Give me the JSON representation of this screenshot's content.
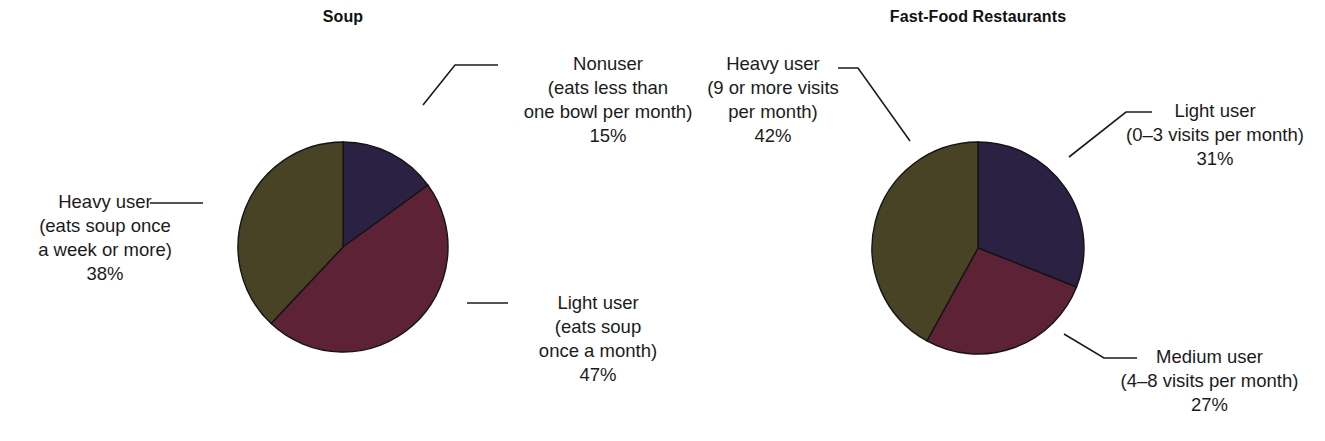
{
  "figure": {
    "background": "#ffffff",
    "width": 1325,
    "height": 441
  },
  "palette": {
    "navy": "#2b2143",
    "maroon": "#5d2235",
    "olive": "#474324",
    "outline": "#141414",
    "leader_line": "#1b1b1b",
    "text": "#1b1b1b"
  },
  "charts": [
    {
      "id": "soup",
      "title": "Soup",
      "center": {
        "x": 343,
        "y": 247
      },
      "radius": 105,
      "slices": [
        {
          "key": "nonuser",
          "label_line1": "Nonuser",
          "label_line2": "(eats less than",
          "label_line3": "one bowl per month)",
          "value_label": "15%",
          "value": 15,
          "color": "#2b2143"
        },
        {
          "key": "light-user",
          "label_line1": "Light user",
          "label_line2": "(eats soup",
          "label_line3": "once a month)",
          "value_label": "47%",
          "value": 47,
          "color": "#5d2235"
        },
        {
          "key": "heavy-user",
          "label_line1": "Heavy user",
          "label_line2": "(eats soup once",
          "label_line3": "a week or more)",
          "value_label": "38%",
          "value": 38,
          "color": "#474324"
        }
      ]
    },
    {
      "id": "fast-food-restaurants",
      "title": "Fast-Food Restaurants",
      "center": {
        "x": 978,
        "y": 248
      },
      "radius": 106,
      "slices": [
        {
          "key": "light-user",
          "label_line1": "Light user",
          "label_line2": "(0–3 visits per month)",
          "label_line3": "",
          "value_label": "31%",
          "value": 31,
          "color": "#2b2143"
        },
        {
          "key": "medium-user",
          "label_line1": "Medium user",
          "label_line2": "(4–8 visits per month)",
          "label_line3": "",
          "value_label": "27%",
          "value": 27,
          "color": "#5d2235"
        },
        {
          "key": "heavy-user",
          "label_line1": "Heavy user",
          "label_line2": "(9 or more visits",
          "label_line3": "per month)",
          "value_label": "42%",
          "value": 42,
          "color": "#474324"
        }
      ]
    }
  ],
  "chart_data": [
    {
      "type": "pie",
      "title": "Soup",
      "labels": [
        "Nonuser (eats less than one bowl per month)",
        "Light user (eats soup once a month)",
        "Heavy user (eats soup once a week or more)"
      ],
      "values": [
        15,
        47,
        38
      ],
      "value_labels": [
        "15%",
        "47%",
        "38%"
      ],
      "colors": [
        "#2b2143",
        "#5d2235",
        "#474324"
      ],
      "units": "percent",
      "start_angle_deg": 0,
      "direction": "clockwise",
      "legend": "callout-labels-with-leader-lines"
    },
    {
      "type": "pie",
      "title": "Fast-Food Restaurants",
      "labels": [
        "Light user (0–3 visits per month)",
        "Medium user (4–8 visits per month)",
        "Heavy user (9 or more visits per month)"
      ],
      "values": [
        31,
        27,
        42
      ],
      "value_labels": [
        "31%",
        "27%",
        "42%"
      ],
      "colors": [
        "#2b2143",
        "#5d2235",
        "#474324"
      ],
      "units": "percent",
      "start_angle_deg": 0,
      "direction": "clockwise",
      "legend": "callout-labels-with-leader-lines"
    }
  ]
}
